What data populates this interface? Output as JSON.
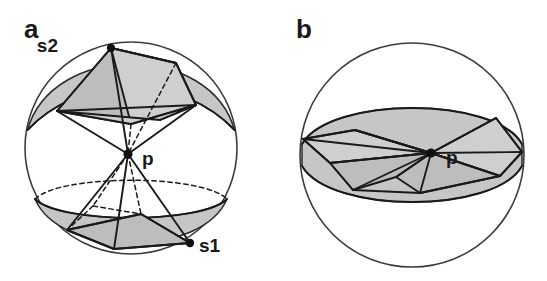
{
  "figure": {
    "background_color": "#ffffff",
    "line_color": "#1a1a1a",
    "shade_color": "#c6c6c6",
    "facet_color": "#bdbdbd",
    "width": 547,
    "height": 281
  },
  "panels": [
    {
      "id": "panel-a",
      "letter": "a",
      "description": "Sphere with a double cone (bowtie) apexed at the centre point p; the upper and lower spherical caps are shaded and a polygonal cone cap is drawn in each.",
      "sphere": {
        "cx": 131,
        "cy": 148,
        "r": 106
      },
      "labels": [
        {
          "name": "s2",
          "text": "s2",
          "x": 63,
          "y": 50,
          "dot_x": 111,
          "dot_y": 48
        },
        {
          "name": "p",
          "text": "p",
          "x": 140,
          "y": 164,
          "dot_x": 128,
          "dot_y": 154
        },
        {
          "name": "s1",
          "text": "s1",
          "x": 199,
          "y": 249,
          "dot_x": 190,
          "dot_y": 243
        }
      ]
    },
    {
      "id": "panel-b",
      "letter": "b",
      "description": "Sphere with a wide flattened double cone forming an equatorial band through the centre point p; the band between the two cutting planes is shaded.",
      "sphere": {
        "cx": 412,
        "cy": 155,
        "r": 112
      },
      "labels": [
        {
          "name": "p",
          "text": "p",
          "x": 446,
          "y": 162,
          "dot_x": 431,
          "dot_y": 153
        }
      ]
    }
  ],
  "panel_letters": {
    "a": "a",
    "b": "b"
  },
  "point_labels": {
    "s1": "s1",
    "s2": "s2",
    "p": "p"
  }
}
